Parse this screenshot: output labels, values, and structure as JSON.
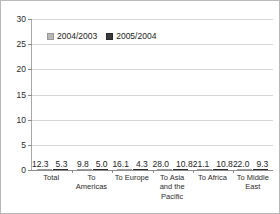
{
  "chart_data": {
    "type": "bar",
    "title": "",
    "subtitle": "",
    "xlabel": "",
    "ylabel": "",
    "ylim": [
      0,
      30
    ],
    "yticks": [
      0,
      5,
      10,
      15,
      20,
      25,
      30
    ],
    "ytick_labels": [
      "0",
      "5",
      "10",
      "15",
      "20",
      "25",
      "30"
    ],
    "grid": true,
    "legend_position": "top-left",
    "categories": [
      "Total",
      "To Americas",
      "To Europe",
      "To Asia and the Pacific",
      "To Africa",
      "To Middle East"
    ],
    "series": [
      {
        "name": "2004/2003",
        "color": "#b8b8b8",
        "values": [
          12.3,
          9.8,
          16.1,
          28.0,
          21.1,
          22.0
        ],
        "labels": [
          "12.3",
          "9.8",
          "16.1",
          "28.0",
          "21.1",
          "22.0"
        ]
      },
      {
        "name": "2005/2004",
        "color": "#3a3a3a",
        "values": [
          5.3,
          5.0,
          4.3,
          10.8,
          10.8,
          9.3
        ],
        "labels": [
          "5.3",
          "5.0",
          "4.3",
          "10.8",
          "10.8",
          "9.3"
        ]
      }
    ]
  },
  "colors": {
    "series_2004_2003": "#b8b8b8",
    "series_2005_2004": "#3a3a3a",
    "gridline": "#d6d6d6",
    "axis": "#8d8d8d",
    "border": "#b9b9b9",
    "text": "#1c1c1c",
    "background": "#ffffff"
  }
}
